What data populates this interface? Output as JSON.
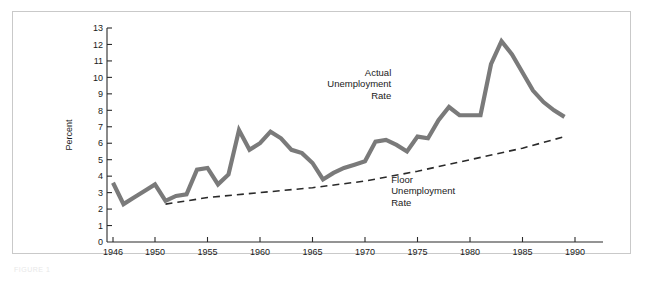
{
  "figure": {
    "caption": "FIGURE 1",
    "frame_color": "#c9c9c9",
    "background": "#ffffff"
  },
  "chart_data": {
    "type": "line",
    "title": "",
    "subtitle": "",
    "xlabel": "",
    "ylabel": "Percent",
    "xlim": [
      1945,
      1992
    ],
    "ylim": [
      0,
      13
    ],
    "grid": false,
    "legend_position": "inline-annotation",
    "x_ticks": [
      1946,
      1950,
      1955,
      1960,
      1965,
      1970,
      1975,
      1980,
      1985,
      1990
    ],
    "y_ticks": [
      0,
      1,
      2,
      3,
      4,
      5,
      6,
      7,
      8,
      9,
      10,
      11,
      12,
      13
    ],
    "series": [
      {
        "name": "Actual Unemployment Rate",
        "color": "#7a7a7a",
        "style": "solid",
        "width": 4.2,
        "x": [
          1946,
          1947,
          1948,
          1949,
          1950,
          1951,
          1952,
          1953,
          1954,
          1955,
          1956,
          1957,
          1958,
          1959,
          1960,
          1961,
          1962,
          1963,
          1964,
          1965,
          1966,
          1967,
          1968,
          1969,
          1970,
          1971,
          1972,
          1973,
          1974,
          1975,
          1976,
          1977,
          1978,
          1979,
          1980,
          1981,
          1982,
          1983,
          1984,
          1985,
          1986,
          1987,
          1988,
          1989
        ],
        "values": [
          3.6,
          2.3,
          2.7,
          3.1,
          3.5,
          2.5,
          2.8,
          2.9,
          4.4,
          4.5,
          3.5,
          4.1,
          6.8,
          5.6,
          6.0,
          6.7,
          6.3,
          5.6,
          5.4,
          4.8,
          3.8,
          4.2,
          4.5,
          4.7,
          4.9,
          6.1,
          6.2,
          5.9,
          5.5,
          6.4,
          6.3,
          7.4,
          8.2,
          7.7,
          7.7,
          7.7,
          10.8,
          12.2,
          11.4,
          10.3,
          9.2,
          8.5,
          8.0,
          7.6
        ]
      },
      {
        "name": "Floor Unemployment Rate",
        "color": "#2a2a2a",
        "style": "dashed",
        "width": 1.6,
        "x": [
          1951,
          1955,
          1960,
          1965,
          1970,
          1975,
          1980,
          1985,
          1989
        ],
        "values": [
          2.3,
          2.7,
          3.0,
          3.3,
          3.7,
          4.3,
          5.0,
          5.7,
          6.4
        ]
      }
    ],
    "annotations": [
      {
        "id": "actual-label",
        "lines": [
          "Actual",
          "Unemployment",
          "Rate"
        ],
        "align": "right",
        "x": 1972.5,
        "y": 10.1
      },
      {
        "id": "floor-label",
        "lines": [
          "Floor",
          "Unemployment",
          "Rate"
        ],
        "align": "left",
        "x": 1972.5,
        "y": 3.6
      }
    ]
  }
}
